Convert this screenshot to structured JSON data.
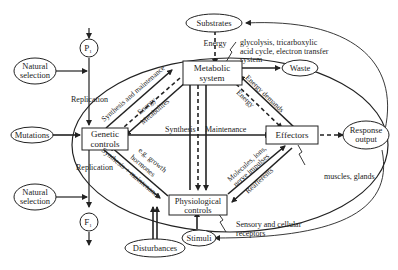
{
  "diagram": {
    "type": "flow-diagram",
    "nodes": {
      "metabolic": {
        "line1": "Metabolic",
        "line2": "system"
      },
      "genetic": {
        "line1": "Genetic",
        "line2": "controls"
      },
      "effectors": {
        "label": "Effectors"
      },
      "physiological": {
        "line1": "Physiological",
        "line2": "controls"
      },
      "substrates": {
        "label": "Substrates"
      },
      "waste": {
        "label": "Waste"
      },
      "response": {
        "line1": "Response",
        "line2": "output"
      },
      "stimuli": {
        "label": "Stimuli"
      },
      "disturbances": {
        "label": "Disturbances"
      },
      "mutations": {
        "label": "Mutations"
      },
      "natural_selection_top": {
        "line1": "Natural",
        "line2": "selection"
      },
      "natural_selection_bottom": {
        "line1": "Natural",
        "line2": "selection"
      },
      "p1": {
        "label": "P",
        "sub": "1"
      },
      "f1": {
        "label": "F",
        "sub": "1"
      }
    },
    "edge_labels": {
      "energy_top": "Energy",
      "glycolysis_1": "glycolysis, tricarboxylic",
      "glycolysis_2": "acid cycle, electron transfer",
      "glycolysis_3": "system",
      "replication_top": "Replication",
      "replication_bottom": "Replication",
      "synthesis_maintenance_top": "Synthesis and maintenance",
      "energy_diag_left": "Energy",
      "metabolites": "Metabolites",
      "energy_demands": "Energy demands",
      "energy_diag_right": "Energy",
      "synthesis": "Synthesis",
      "maintenance": "Maintenance",
      "eg_growth": "e.g. growth",
      "hormones": "hormones",
      "synthesis_plus_maintenance": "Synthesis + maintenance",
      "molecules_ions": "Molecules, ions,",
      "nerve_impulses": "nerve impulses",
      "reafferents": "Reafferents",
      "muscles_glands": "muscles, glands",
      "sensory_1": "Sensory and cellular",
      "sensory_2": "receptors"
    }
  }
}
